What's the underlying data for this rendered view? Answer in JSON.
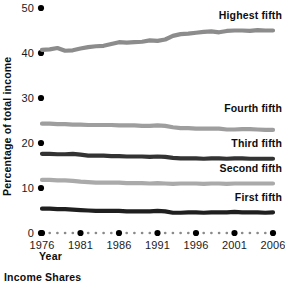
{
  "chart_data": {
    "type": "line",
    "title": "",
    "caption": "Income Shares",
    "xlabel": "Year",
    "ylabel": "Percentage of total income",
    "xlim": [
      1976,
      2006
    ],
    "ylim": [
      0,
      50
    ],
    "yticks": [
      0,
      10,
      20,
      30,
      40,
      50
    ],
    "ytick_labels": [
      "0",
      "10",
      "20",
      "30",
      "40",
      "50"
    ],
    "xticks": [
      1976,
      1981,
      1986,
      1991,
      1996,
      2001,
      2006
    ],
    "xtick_labels": [
      "1976",
      "1981",
      "1986",
      "1991",
      "1996",
      "2001",
      "2006"
    ],
    "grid": false,
    "legend_position": "inline-right",
    "x": [
      1976,
      1977,
      1978,
      1979,
      1980,
      1981,
      1982,
      1983,
      1984,
      1985,
      1986,
      1987,
      1988,
      1989,
      1990,
      1991,
      1992,
      1993,
      1994,
      1995,
      1996,
      1997,
      1998,
      1999,
      2000,
      2001,
      2002,
      2003,
      2004,
      2005,
      2006
    ],
    "series": [
      {
        "name": "Highest fifth",
        "color": "#8c8c8c",
        "label_x": 2006,
        "label_y": 47.5,
        "values": [
          40.7,
          40.8,
          41.1,
          40.5,
          40.6,
          41.0,
          41.3,
          41.5,
          41.6,
          42.0,
          42.4,
          42.3,
          42.4,
          42.5,
          42.8,
          42.7,
          43.0,
          43.8,
          44.2,
          44.3,
          44.5,
          44.7,
          44.8,
          44.6,
          44.9,
          45.0,
          45.0,
          44.9,
          45.1,
          45.0,
          45.0
        ]
      },
      {
        "name": "Fourth fifth",
        "color": "#9e9e9e",
        "label_x": 2006,
        "label_y": 26.8,
        "values": [
          24.3,
          24.3,
          24.2,
          24.2,
          24.1,
          24.1,
          24.0,
          24.0,
          24.0,
          24.0,
          23.9,
          23.9,
          23.9,
          23.8,
          23.8,
          23.9,
          23.8,
          23.5,
          23.3,
          23.3,
          23.2,
          23.2,
          23.2,
          23.2,
          23.0,
          23.0,
          23.1,
          23.1,
          23.0,
          22.9,
          22.9
        ]
      },
      {
        "name": "Third fifth",
        "color": "#333333",
        "label_x": 2006,
        "label_y": 19.2,
        "values": [
          17.6,
          17.6,
          17.5,
          17.5,
          17.6,
          17.4,
          17.2,
          17.2,
          17.2,
          17.1,
          17.1,
          17.0,
          17.0,
          17.0,
          16.9,
          17.0,
          16.9,
          16.7,
          16.6,
          16.6,
          16.6,
          16.5,
          16.6,
          16.6,
          16.5,
          16.6,
          16.6,
          16.5,
          16.5,
          16.5,
          16.5
        ]
      },
      {
        "name": "Second fifth",
        "color": "#aaaaaa",
        "label_x": 2006,
        "label_y": 13.5,
        "values": [
          11.8,
          11.8,
          11.7,
          11.7,
          11.6,
          11.4,
          11.3,
          11.2,
          11.2,
          11.2,
          11.2,
          11.1,
          11.1,
          11.1,
          11.0,
          11.1,
          11.0,
          10.9,
          11.0,
          11.0,
          11.0,
          10.9,
          11.0,
          11.0,
          10.9,
          11.0,
          11.0,
          11.0,
          11.0,
          11.0,
          11.0
        ]
      },
      {
        "name": "First fifth",
        "color": "#1f1f1f",
        "label_x": 2006,
        "label_y": 7.2,
        "values": [
          5.4,
          5.4,
          5.3,
          5.3,
          5.2,
          5.1,
          5.0,
          4.9,
          4.9,
          4.9,
          4.9,
          4.8,
          4.8,
          4.8,
          4.8,
          4.9,
          4.8,
          4.5,
          4.5,
          4.6,
          4.6,
          4.5,
          4.6,
          4.6,
          4.6,
          4.7,
          4.6,
          4.6,
          4.6,
          4.5,
          4.6
        ]
      }
    ]
  },
  "axis": {
    "y_title": "Percentage of total income",
    "x_title": "Year"
  },
  "caption": {
    "text": "Income Shares"
  },
  "colors": {
    "text": "#111111",
    "dot": "#000000",
    "background": "#ffffff"
  }
}
